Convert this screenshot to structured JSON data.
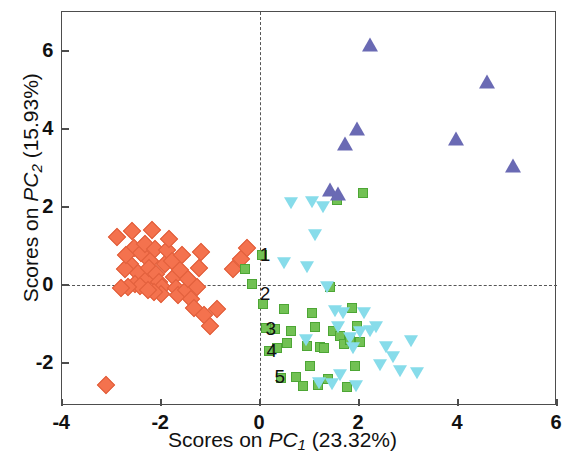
{
  "chart_data": {
    "type": "scatter",
    "title": "",
    "xlabel": "Scores on PC1 (23.32%)",
    "ylabel": "Scores on PC2 (15.93%)",
    "xlabel_parts": {
      "prefix": "Scores on ",
      "pc": "PC",
      "sub": "1",
      "suffix": " (23.32%)"
    },
    "ylabel_parts": {
      "prefix": "Scores on ",
      "pc": "PC",
      "sub": "2",
      "suffix": " (15.93%)"
    },
    "xlim": [
      -4,
      6
    ],
    "ylim": [
      -3.1,
      7.0
    ],
    "xticks": [
      -4,
      -2,
      0,
      2,
      4,
      6
    ],
    "yticks": [
      -2,
      0,
      2,
      4,
      6
    ],
    "xtick_labels": [
      "-4",
      "-2",
      "0",
      "2",
      "4",
      "6"
    ],
    "ytick_labels": [
      "-2",
      "0",
      "2",
      "4",
      "6"
    ],
    "grid": false,
    "legend": "none",
    "reference_lines": {
      "horizontal": 0,
      "vertical": 0,
      "style": "dashed",
      "color": "#555555"
    },
    "annotations": [
      {
        "text": "1",
        "x": 0.1,
        "y": 0.78
      },
      {
        "text": "2",
        "x": 0.1,
        "y": -0.22
      },
      {
        "text": "3",
        "x": 0.22,
        "y": -1.12
      },
      {
        "text": "4",
        "x": 0.24,
        "y": -1.68
      },
      {
        "text": "5",
        "x": 0.4,
        "y": -2.35
      }
    ],
    "series": [
      {
        "name": "Group A",
        "marker": "diamond",
        "color": "#f4724e",
        "points": [
          [
            -3.12,
            -2.55
          ],
          [
            -2.88,
            1.22
          ],
          [
            -2.55,
            0.96
          ],
          [
            -2.62,
            0.55
          ],
          [
            -2.4,
            0.82
          ],
          [
            -2.32,
            1.05
          ],
          [
            -2.22,
            0.62
          ],
          [
            -2.46,
            0.3
          ],
          [
            -2.3,
            0.12
          ],
          [
            -2.72,
            0.42
          ],
          [
            -2.52,
            0.02
          ],
          [
            -2.42,
            -0.02
          ],
          [
            -2.66,
            -0.05
          ],
          [
            -2.8,
            -0.08
          ],
          [
            -2.24,
            0.45
          ],
          [
            -2.12,
            0.92
          ],
          [
            -2.1,
            0.28
          ],
          [
            -2.04,
            0.08
          ],
          [
            -1.98,
            -0.05
          ],
          [
            -2.0,
            -0.22
          ],
          [
            -2.14,
            -0.18
          ],
          [
            -2.26,
            -0.12
          ],
          [
            -1.92,
            0.55
          ],
          [
            -1.88,
            0.9
          ],
          [
            -1.84,
            1.18
          ],
          [
            -1.78,
            0.62
          ],
          [
            -1.74,
            0.2
          ],
          [
            -1.7,
            -0.08
          ],
          [
            -1.66,
            -0.25
          ],
          [
            -1.62,
            0.38
          ],
          [
            -1.58,
            0.78
          ],
          [
            -1.5,
            -0.12
          ],
          [
            -1.46,
            0.15
          ],
          [
            -1.4,
            -0.35
          ],
          [
            -1.34,
            -0.58
          ],
          [
            -1.28,
            -0.05
          ],
          [
            -1.24,
            0.45
          ],
          [
            -1.2,
            0.85
          ],
          [
            -1.14,
            -0.78
          ],
          [
            -1.02,
            -1.05
          ],
          [
            -0.86,
            -0.62
          ],
          [
            -0.55,
            0.42
          ],
          [
            -0.38,
            0.66
          ],
          [
            -0.26,
            0.95
          ],
          [
            -2.7,
            0.78
          ],
          [
            -2.58,
            1.38
          ],
          [
            -2.18,
            1.4
          ]
        ]
      },
      {
        "name": "Group B",
        "marker": "square",
        "color": "#72c154",
        "points": [
          [
            -0.3,
            0.4
          ],
          [
            -0.16,
            0.02
          ],
          [
            0.04,
            0.78
          ],
          [
            0.06,
            -0.48
          ],
          [
            0.12,
            -1.1
          ],
          [
            0.18,
            -1.7
          ],
          [
            0.42,
            -2.38
          ],
          [
            0.3,
            -1.12
          ],
          [
            0.34,
            -1.62
          ],
          [
            0.55,
            -1.48
          ],
          [
            0.62,
            -1.18
          ],
          [
            0.72,
            -2.35
          ],
          [
            0.86,
            -2.58
          ],
          [
            0.95,
            -1.55
          ],
          [
            1.05,
            -0.72
          ],
          [
            1.12,
            -1.08
          ],
          [
            1.22,
            -1.58
          ],
          [
            1.3,
            -1.62
          ],
          [
            1.38,
            -2.42
          ],
          [
            1.42,
            -0.05
          ],
          [
            1.48,
            -1.18
          ],
          [
            1.55,
            2.18
          ],
          [
            1.62,
            -1.3
          ],
          [
            1.7,
            -1.5
          ],
          [
            1.75,
            -2.62
          ],
          [
            1.82,
            -1.42
          ],
          [
            1.86,
            -0.6
          ],
          [
            1.92,
            -2.08
          ],
          [
            1.95,
            -1.05
          ],
          [
            2.02,
            -1.45
          ],
          [
            2.08,
            2.35
          ],
          [
            0.48,
            -0.62
          ],
          [
            1.18,
            -2.55
          ],
          [
            1.02,
            -2.08
          ]
        ]
      },
      {
        "name": "Group C",
        "marker": "triangle-down",
        "color": "#87dcea",
        "points": [
          [
            0.48,
            0.6
          ],
          [
            0.62,
            2.12
          ],
          [
            1.05,
            2.15
          ],
          [
            1.12,
            1.3
          ],
          [
            1.28,
            2.02
          ],
          [
            0.95,
            0.48
          ],
          [
            1.35,
            -0.02
          ],
          [
            1.52,
            -0.65
          ],
          [
            1.58,
            -1.05
          ],
          [
            1.68,
            -0.68
          ],
          [
            1.82,
            -1.32
          ],
          [
            1.88,
            -1.58
          ],
          [
            1.94,
            -2.55
          ],
          [
            2.02,
            -1.18
          ],
          [
            2.1,
            -0.68
          ],
          [
            2.22,
            -1.15
          ],
          [
            2.35,
            -1.05
          ],
          [
            2.55,
            -1.55
          ],
          [
            2.68,
            -1.82
          ],
          [
            2.82,
            -2.18
          ],
          [
            3.05,
            -1.42
          ],
          [
            3.18,
            -2.22
          ],
          [
            1.45,
            -2.52
          ],
          [
            1.2,
            -2.48
          ],
          [
            1.62,
            -2.28
          ],
          [
            0.92,
            -1.38
          ],
          [
            2.42,
            -2.02
          ]
        ]
      },
      {
        "name": "Group D",
        "marker": "triangle-up",
        "color": "#6a6ab4",
        "points": [
          [
            1.42,
            2.42
          ],
          [
            1.58,
            2.32
          ],
          [
            1.95,
            3.98
          ],
          [
            1.72,
            3.58
          ],
          [
            2.22,
            6.12
          ],
          [
            3.95,
            3.72
          ],
          [
            4.58,
            5.18
          ],
          [
            5.12,
            3.02
          ]
        ]
      }
    ]
  }
}
